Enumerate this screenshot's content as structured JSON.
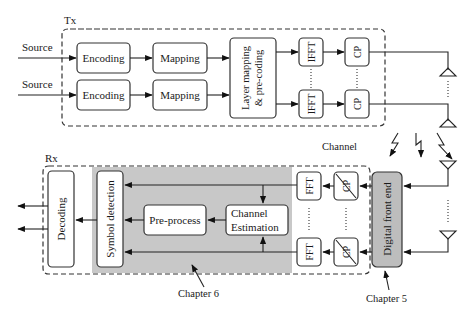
{
  "tx": {
    "label": "Tx",
    "sources": [
      "Source",
      "Source"
    ],
    "encoding": [
      "Encoding",
      "Encoding"
    ],
    "mapping": [
      "Mapping",
      "Mapping"
    ],
    "layer_mapping": {
      "line1": "Layer mapping",
      "line2": "& pre-coding"
    },
    "ifft": [
      "IFFT",
      "IFFT"
    ],
    "cp": [
      "CP",
      "CP"
    ]
  },
  "channel": {
    "label": "Channel"
  },
  "rx": {
    "label": "Rx",
    "decoding": "Decoding",
    "symbol_detection": "Symbol detection",
    "pre_process": "Pre-process",
    "channel_estimation": {
      "line1": "Channel",
      "line2": "Estimation"
    },
    "fft": [
      "FFT",
      "FFT"
    ],
    "cp_removal": [
      "CP",
      "CP"
    ],
    "digital_front_end": "Digital front end"
  },
  "annotations": {
    "chapter6": "Chapter 6",
    "chapter5": "Chapter 5"
  },
  "colors": {
    "shaded_region": "#c8c8c8",
    "front_end_fill": "#bdbdbd"
  }
}
